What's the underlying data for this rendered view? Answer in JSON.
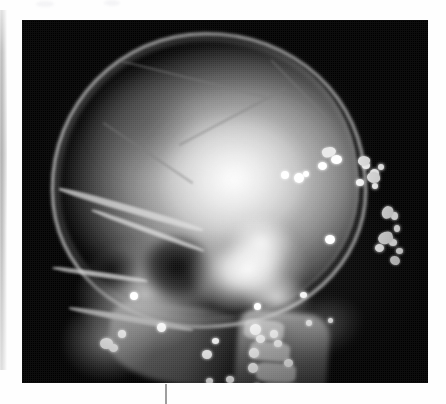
{
  "page": {
    "background_color": "#fefefe",
    "caption": ""
  },
  "gutter_strip": {
    "name": "scanned-page-edge",
    "x": 0,
    "y": 10,
    "width": 7,
    "height": 360,
    "color": "#c4c4c4"
  },
  "bottom_rule": {
    "name": "vertical-rule",
    "x": 165,
    "y": 384,
    "width": 2,
    "height": 20,
    "color": "#9e9e9e"
  },
  "scan_artifacts": [
    {
      "x": 36,
      "y": 1,
      "w": 18,
      "h": 6,
      "color": "#f4f4f6"
    },
    {
      "x": 104,
      "y": 0,
      "w": 16,
      "h": 6,
      "color": "#f4f4f6"
    }
  ],
  "radiograph": {
    "name": "lateral-skull-radiograph",
    "alt_text": "Lateral skull radiograph showing multiple radiopaque metallic fragments",
    "modality": "X-ray",
    "projection": "Lateral",
    "anatomy": "Skull and cervical spine",
    "frame": {
      "x": 22,
      "y": 20,
      "width": 406,
      "height": 363
    },
    "background_color": "#000000",
    "film_label": "",
    "findings": [
      "Intact calvarium in lateral projection",
      "Multiple radiopaque metallic fragments over posterior cranium",
      "Radiopaque pellets overlying facial skeleton and maxilla",
      "Linear array of pellets along cervical soft tissues"
    ],
    "regions": [
      {
        "name": "cranial-vault",
        "label": "Cranial vault"
      },
      {
        "name": "frontal-region",
        "label": "Frontal bone"
      },
      {
        "name": "orbit",
        "label": "Orbit"
      },
      {
        "name": "maxillofacial",
        "label": "Facial skeleton"
      },
      {
        "name": "skull-base",
        "label": "Skull base / petrous"
      },
      {
        "name": "mandible",
        "label": "Mandibular ramus"
      },
      {
        "name": "cervical-spine",
        "label": "Cervical spine"
      },
      {
        "name": "occiput",
        "label": "Occipital region"
      }
    ],
    "fragments": {
      "count_visible": 34,
      "color": "#ffffff",
      "pellets": [
        {
          "x": 296,
          "y": 142,
          "w": 9,
          "h": 8
        },
        {
          "x": 309,
          "y": 135,
          "w": 11,
          "h": 9
        },
        {
          "x": 281,
          "y": 151,
          "w": 6,
          "h": 6
        },
        {
          "x": 340,
          "y": 142,
          "w": 8,
          "h": 7
        },
        {
          "x": 348,
          "y": 149,
          "w": 9,
          "h": 8
        },
        {
          "x": 356,
          "y": 144,
          "w": 6,
          "h": 6
        },
        {
          "x": 334,
          "y": 159,
          "w": 8,
          "h": 7
        },
        {
          "x": 350,
          "y": 163,
          "w": 6,
          "h": 6
        },
        {
          "x": 272,
          "y": 153,
          "w": 10,
          "h": 10
        },
        {
          "x": 259,
          "y": 151,
          "w": 8,
          "h": 8
        },
        {
          "x": 369,
          "y": 192,
          "w": 7,
          "h": 8
        },
        {
          "x": 372,
          "y": 205,
          "w": 6,
          "h": 7
        },
        {
          "x": 303,
          "y": 215,
          "w": 10,
          "h": 9
        },
        {
          "x": 367,
          "y": 219,
          "w": 8,
          "h": 7
        },
        {
          "x": 353,
          "y": 224,
          "w": 9,
          "h": 8
        },
        {
          "x": 374,
          "y": 228,
          "w": 7,
          "h": 6
        },
        {
          "x": 278,
          "y": 272,
          "w": 7,
          "h": 6
        },
        {
          "x": 108,
          "y": 272,
          "w": 8,
          "h": 8
        },
        {
          "x": 232,
          "y": 283,
          "w": 7,
          "h": 7
        },
        {
          "x": 135,
          "y": 303,
          "w": 9,
          "h": 9
        },
        {
          "x": 96,
          "y": 310,
          "w": 8,
          "h": 8
        },
        {
          "x": 78,
          "y": 318,
          "w": 13,
          "h": 11
        },
        {
          "x": 87,
          "y": 324,
          "w": 9,
          "h": 8
        },
        {
          "x": 228,
          "y": 304,
          "w": 11,
          "h": 11
        },
        {
          "x": 234,
          "y": 315,
          "w": 9,
          "h": 8
        },
        {
          "x": 248,
          "y": 310,
          "w": 8,
          "h": 8
        },
        {
          "x": 227,
          "y": 328,
          "w": 10,
          "h": 10
        },
        {
          "x": 226,
          "y": 343,
          "w": 10,
          "h": 10
        },
        {
          "x": 180,
          "y": 330,
          "w": 10,
          "h": 9
        },
        {
          "x": 190,
          "y": 318,
          "w": 7,
          "h": 6
        },
        {
          "x": 252,
          "y": 320,
          "w": 8,
          "h": 7
        },
        {
          "x": 262,
          "y": 339,
          "w": 9,
          "h": 8
        },
        {
          "x": 184,
          "y": 358,
          "w": 7,
          "h": 6
        },
        {
          "x": 204,
          "y": 356,
          "w": 8,
          "h": 7
        },
        {
          "x": 232,
          "y": 363,
          "w": 6,
          "h": 6
        },
        {
          "x": 284,
          "y": 300,
          "w": 6,
          "h": 6
        },
        {
          "x": 306,
          "y": 298,
          "w": 5,
          "h": 5
        }
      ],
      "irregular": [
        {
          "x": 300,
          "y": 127,
          "w": 14,
          "h": 10,
          "r": "40% 60% 50% 45%",
          "rot": -18
        },
        {
          "x": 336,
          "y": 136,
          "w": 12,
          "h": 10,
          "r": "55% 40% 60% 45%",
          "rot": 12
        },
        {
          "x": 345,
          "y": 152,
          "w": 13,
          "h": 11,
          "r": "45% 55% 40% 60%",
          "rot": -8
        },
        {
          "x": 360,
          "y": 186,
          "w": 11,
          "h": 13,
          "r": "50% 45% 55% 50%",
          "rot": 22
        },
        {
          "x": 356,
          "y": 212,
          "w": 15,
          "h": 12,
          "r": "60% 40% 50% 55%",
          "rot": -14
        },
        {
          "x": 368,
          "y": 236,
          "w": 10,
          "h": 9,
          "r": "45% 55% 45% 55%",
          "rot": 6
        }
      ]
    }
  }
}
